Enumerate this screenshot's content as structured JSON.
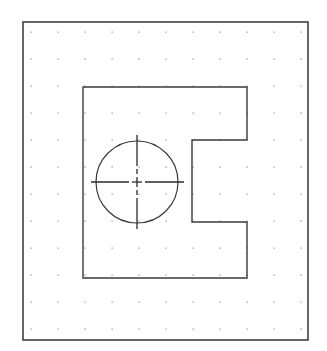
{
  "drawing": {
    "type": "cad-sketch",
    "frame": {
      "x": 23,
      "y": 22,
      "width": 285,
      "height": 318,
      "stroke": "#404040"
    },
    "grid": {
      "x0": 31,
      "y0": 32,
      "spacing": 27.0,
      "cols": 11,
      "rows": 12,
      "dot_color": "#8a8a8a"
    },
    "part_outline": {
      "stroke": "#3a3a3a",
      "points": [
        [
          83,
          87
        ],
        [
          247,
          87
        ],
        [
          247,
          140
        ],
        [
          192,
          140
        ],
        [
          192,
          222
        ],
        [
          247,
          222
        ],
        [
          247,
          278
        ],
        [
          83,
          278
        ]
      ]
    },
    "hole": {
      "cx": 137,
      "cy": 182,
      "r": 41,
      "stroke": "#3a3a3a"
    },
    "centerlines": {
      "horizontal": {
        "x1": 91,
        "x2": 184,
        "y": 182
      },
      "vertical": {
        "y1": 135,
        "y2": 229,
        "x": 137
      },
      "stroke": "#2a2a2a"
    }
  }
}
